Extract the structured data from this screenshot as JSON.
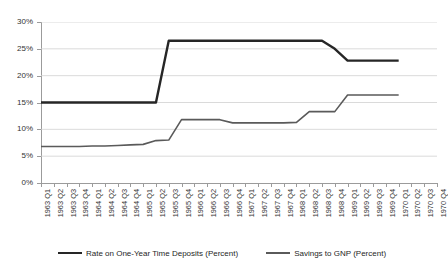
{
  "chart_data": {
    "type": "line",
    "title": "",
    "subtitle": "",
    "xlabel": "",
    "ylabel": "",
    "ylim": [
      0,
      30
    ],
    "ytick_values": [
      0,
      5,
      10,
      15,
      20,
      25,
      30
    ],
    "ytick_labels": [
      "0%",
      "5%",
      "10%",
      "15%",
      "20%",
      "25%",
      "30%"
    ],
    "grid": true,
    "grid_axis": "y",
    "legend_position": "bottom",
    "categories": [
      "1963 Q1",
      "1963 Q2",
      "1963 Q3",
      "1963 Q4",
      "1964 Q1",
      "1964 Q2",
      "1964 Q3",
      "1964 Q4",
      "1965 Q1",
      "1965 Q2",
      "1965 Q3",
      "1965 Q4",
      "1966 Q1",
      "1966 Q2",
      "1966 Q3",
      "1966 Q4",
      "1967 Q1",
      "1967 Q2",
      "1967 Q3",
      "1967 Q4",
      "1968 Q1",
      "1968 Q2",
      "1968 Q3",
      "1968 Q4",
      "1969 Q1",
      "1969 Q2",
      "1969 Q3",
      "1969 Q4",
      "1970 Q1",
      "1970 Q2",
      "1970 Q3",
      "1970 Q4"
    ],
    "series": [
      {
        "name": "Rate on One-Year Time Deposits (Percent)",
        "color": "#262626",
        "width": 2.4,
        "values": [
          15.0,
          15.0,
          15.0,
          15.0,
          15.0,
          15.0,
          15.0,
          15.0,
          15.0,
          15.0,
          26.5,
          26.5,
          26.5,
          26.5,
          26.5,
          26.5,
          26.5,
          26.5,
          26.5,
          26.5,
          26.5,
          26.5,
          26.5,
          25.0,
          22.8,
          22.8,
          22.8,
          22.8,
          22.8,
          null,
          null,
          null
        ]
      },
      {
        "name": "Savings to GNP (Percent)",
        "color": "#5a5a5a",
        "width": 1.6,
        "values": [
          6.8,
          6.8,
          6.8,
          6.8,
          6.9,
          6.9,
          7.0,
          7.1,
          7.2,
          7.9,
          8.0,
          11.8,
          11.8,
          11.8,
          11.8,
          11.2,
          11.2,
          11.2,
          11.2,
          11.2,
          11.3,
          13.3,
          13.3,
          13.3,
          16.4,
          16.4,
          16.4,
          16.4,
          16.4,
          null,
          null,
          null
        ]
      }
    ]
  },
  "legend": {
    "items": [
      {
        "label": "Rate on One-Year Time Deposits (Percent)"
      },
      {
        "label": "Savings to GNP (Percent)"
      }
    ]
  }
}
